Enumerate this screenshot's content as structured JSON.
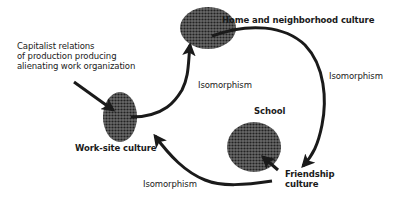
{
  "diagram": {
    "nodes": {
      "home": {
        "label": "Home and neighborhood culture"
      },
      "worksite": {
        "label": "Work-site culture"
      },
      "school": {
        "label": "School"
      },
      "friendship": {
        "label_line1": "Friendship",
        "label_line2": "culture"
      }
    },
    "external_input": {
      "line1": "Capitalist relations",
      "line2": "of production producing",
      "line3": "alienating work organization"
    },
    "edges": {
      "worksite_to_home": {
        "label": "Isomorphism"
      },
      "home_to_friendship": {
        "label": "Isomorphism"
      },
      "friendship_to_worksite": {
        "label": "Isomorphism"
      },
      "friendship_to_school": {
        "label": ""
      },
      "capitalist_to_worksite": {
        "label": ""
      }
    },
    "colors": {
      "ink": "#1a1a1a",
      "node_fill": "#4a4a4a",
      "background": "#ffffff"
    }
  }
}
